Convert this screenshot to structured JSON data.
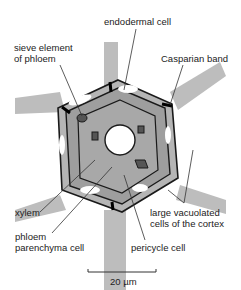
{
  "diagram": {
    "labels": {
      "endodermal_cell": "endodermal cell",
      "sieve_element_line1": "sieve element",
      "sieve_element_line2": "of phloem",
      "casparian_band": "Casparian band",
      "xylem": "xylem",
      "phloem_parenchyma_line1": "phloem",
      "phloem_parenchyma_line2": "parenchyma cell",
      "pericycle_cell": "pericycle cell",
      "cortex_line1": "large vacuolated",
      "cortex_line2": "cells of the cortex"
    },
    "scale_bar": {
      "label": "20 µm"
    },
    "colors": {
      "cell_wall_fill": "#b8b8b8",
      "cell_interior": "#9e9e9e",
      "dark_cell": "#555555",
      "vacuole": "#ffffff",
      "line": "#1a1a1a"
    }
  }
}
